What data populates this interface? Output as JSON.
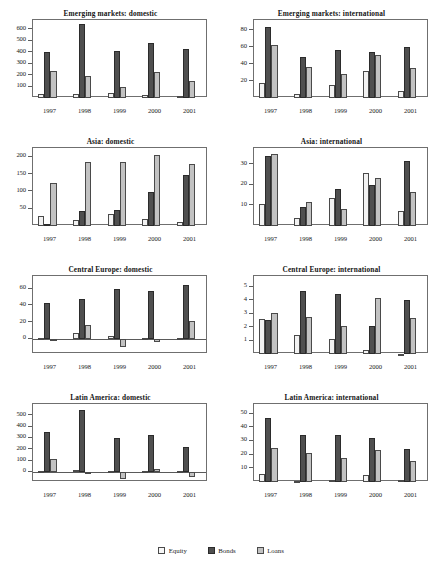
{
  "legend": {
    "items": [
      {
        "key": "equity",
        "label": "Equity",
        "color": "#f2f2f2"
      },
      {
        "key": "bonds",
        "label": "Bonds",
        "color": "#4f4f4f"
      },
      {
        "key": "loans",
        "label": "Loans",
        "color": "#c2c2c2"
      }
    ]
  },
  "chart_data": [
    {
      "type": "bar",
      "title": "Emerging markets: domestic",
      "xlabel": "",
      "ylabel": "",
      "categories": [
        "1997",
        "1998",
        "1999",
        "2000",
        "2001"
      ],
      "ticks": [
        100,
        200,
        300,
        400,
        500,
        600
      ],
      "ylim": [
        0,
        680
      ],
      "grid": false,
      "legend_position": "figure-bottom-center",
      "series": [
        {
          "name": "Equity",
          "values": [
            38,
            35,
            45,
            25,
            20
          ]
        },
        {
          "name": "Bonds",
          "values": [
            398,
            645,
            408,
            480,
            430
          ]
        },
        {
          "name": "Loans",
          "values": [
            235,
            192,
            97,
            228,
            152
          ]
        }
      ]
    },
    {
      "type": "bar",
      "title": "Emerging markets: international",
      "xlabel": "",
      "ylabel": "",
      "categories": [
        "1997",
        "1998",
        "1999",
        "2000",
        "2001"
      ],
      "ticks": [
        20,
        40,
        60,
        80
      ],
      "ylim": [
        0,
        92
      ],
      "grid": false,
      "series": [
        {
          "name": "Equity",
          "values": [
            18,
            5,
            15,
            32,
            8
          ]
        },
        {
          "name": "Bonds",
          "values": [
            84,
            48,
            57,
            54,
            60
          ]
        },
        {
          "name": "Loans",
          "values": [
            62,
            36,
            28,
            51,
            35
          ]
        }
      ]
    },
    {
      "type": "bar",
      "title": "Asia: domestic",
      "xlabel": "",
      "ylabel": "",
      "categories": [
        "1997",
        "1998",
        "1999",
        "2000",
        "2001"
      ],
      "ticks": [
        50,
        100,
        150,
        200
      ],
      "ylim": [
        0,
        225
      ],
      "grid": false,
      "series": [
        {
          "name": "Equity",
          "values": [
            30,
            16,
            34,
            20,
            11
          ]
        },
        {
          "name": "Bonds",
          "values": [
            7,
            43,
            46,
            97,
            146
          ]
        },
        {
          "name": "Loans",
          "values": [
            124,
            184,
            186,
            206,
            180
          ]
        }
      ]
    },
    {
      "type": "bar",
      "title": "Asia: international",
      "xlabel": "",
      "ylabel": "",
      "categories": [
        "1997",
        "1998",
        "1999",
        "2000",
        "2001"
      ],
      "ticks": [
        10,
        20,
        30
      ],
      "ylim": [
        0,
        38
      ],
      "grid": false,
      "series": [
        {
          "name": "Equity",
          "values": [
            10.5,
            4,
            13.7,
            26,
            7.5
          ]
        },
        {
          "name": "Bonds",
          "values": [
            34,
            9.2,
            18,
            20.2,
            31.5
          ]
        },
        {
          "name": "Loans",
          "values": [
            35,
            11.7,
            8.5,
            23.5,
            16.7
          ]
        }
      ]
    },
    {
      "type": "bar",
      "title": "Central Europe: domestic",
      "xlabel": "",
      "ylabel": "",
      "categories": [
        "1997",
        "1998",
        "1999",
        "2000",
        "2001"
      ],
      "ticks": [
        0,
        20,
        40,
        60
      ],
      "ylim": [
        -18,
        75
      ],
      "grid": false,
      "series": [
        {
          "name": "Equity",
          "values": [
            1,
            6.5,
            3,
            1.2,
            1
          ]
        },
        {
          "name": "Bonds",
          "values": [
            43,
            47.5,
            60,
            57,
            64.5
          ]
        },
        {
          "name": "Loans",
          "values": [
            -2,
            16,
            -10,
            -4,
            21.5
          ]
        }
      ]
    },
    {
      "type": "bar",
      "title": "Central Europe: international",
      "xlabel": "",
      "ylabel": "",
      "categories": [
        "1997",
        "1998",
        "1999",
        "2000",
        "2001"
      ],
      "ticks": [
        1,
        2,
        3,
        4,
        5
      ],
      "ylim": [
        0,
        5.8
      ],
      "grid": false,
      "series": [
        {
          "name": "Equity",
          "values": [
            2.6,
            1.45,
            1.15,
            0.3,
            0
          ]
        },
        {
          "name": "Bonds",
          "values": [
            2.5,
            4.65,
            4.45,
            2.1,
            4.05
          ]
        },
        {
          "name": "Loans",
          "values": [
            3.05,
            2.75,
            2.1,
            4.2,
            2.65
          ]
        }
      ]
    },
    {
      "type": "bar",
      "title": "Latin America: domestic",
      "xlabel": "",
      "ylabel": "",
      "categories": [
        "1997",
        "1998",
        "1999",
        "2000",
        "2001"
      ],
      "ticks": [
        0,
        100,
        200,
        300,
        400,
        500
      ],
      "ylim": [
        -90,
        600
      ],
      "grid": false,
      "series": [
        {
          "name": "Equity",
          "values": [
            10,
            13,
            5,
            6,
            6
          ]
        },
        {
          "name": "Bonds",
          "values": [
            350,
            545,
            300,
            325,
            218
          ]
        },
        {
          "name": "Loans",
          "values": [
            110,
            -5,
            -65,
            25,
            -42
          ]
        }
      ]
    },
    {
      "type": "bar",
      "title": "Latin America: international",
      "xlabel": "",
      "ylabel": "",
      "categories": [
        "1997",
        "1998",
        "1999",
        "2000",
        "2001"
      ],
      "ticks": [
        10,
        20,
        30,
        40,
        50
      ],
      "ylim": [
        0,
        57
      ],
      "grid": false,
      "series": [
        {
          "name": "Equity",
          "values": [
            5.5,
            0.5,
            1.2,
            5.2,
            1.3
          ]
        },
        {
          "name": "Bonds",
          "values": [
            47,
            34.5,
            34.5,
            32,
            24.2
          ]
        },
        {
          "name": "Loans",
          "values": [
            24.8,
            21.5,
            17.5,
            23.5,
            15
          ]
        }
      ]
    }
  ]
}
